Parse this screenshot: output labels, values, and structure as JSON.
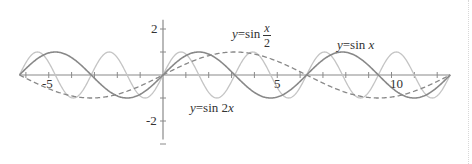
{
  "chart_data": {
    "type": "line",
    "title": "",
    "xlabel": "",
    "ylabel": "",
    "xlim": [
      -6.28,
      12.57
    ],
    "ylim": [
      -2.8,
      2.4
    ],
    "x_ticks_major_labels": [
      {
        "value": -5,
        "label": "-5"
      },
      {
        "value": 5,
        "label": "5"
      },
      {
        "value": 10,
        "label": "10"
      }
    ],
    "y_ticks_major_labels": [
      {
        "value": 2,
        "label": "2"
      },
      {
        "value": -2,
        "label": "-2"
      }
    ],
    "x_tick_step": 1,
    "y_tick_step": 1,
    "grid": false,
    "legend": "inline annotations",
    "series": [
      {
        "name": "y=sin x",
        "expr": "sin(x)",
        "style": "solid",
        "color": "#888888",
        "width": 1.6
      },
      {
        "name": "y=sin x/2",
        "expr": "sin(x/2)",
        "style": "dashed",
        "color": "#888888",
        "width": 1.3
      },
      {
        "name": "y=sin 2x",
        "expr": "sin(2x)",
        "style": "solid",
        "color": "#c4c4c4",
        "width": 1.3
      }
    ],
    "annotations": [
      {
        "text": "y=sin x",
        "x": 8.2,
        "y": 1.3
      },
      {
        "text": "y=sin x/2",
        "x": 3.2,
        "y": 1.4
      },
      {
        "text": "y=sin 2x",
        "x": 1.2,
        "y": -1.5
      }
    ]
  },
  "labels": {
    "sinx_prefix": "y",
    "sinx_eq": "=sin ",
    "sinx_var": "x",
    "sinhalf_prefix": "y",
    "sinhalf_eq": "=sin",
    "sinhalf_num": "x",
    "sinhalf_den": "2",
    "sin2x_prefix": "y",
    "sin2x_eq": "=sin 2",
    "sin2x_var": "x",
    "xtick_m5": "-5",
    "xtick_5": "5",
    "xtick_10": "10",
    "ytick_2": "2",
    "ytick_m2": "-2"
  }
}
